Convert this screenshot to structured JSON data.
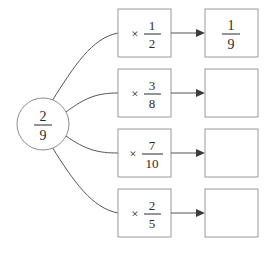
{
  "diagram": {
    "type": "fraction-multiplication-flow",
    "source": {
      "label": "2/9",
      "numerator": "2",
      "denominator": "9",
      "shape": "circle"
    },
    "operation_symbol": "×",
    "rows": [
      {
        "operation": {
          "symbol": "×",
          "numerator": "1",
          "denominator": "2",
          "label": "× 1/2"
        },
        "result": {
          "numerator": "1",
          "denominator": "9",
          "label": "1/9",
          "filled": true
        }
      },
      {
        "operation": {
          "symbol": "×",
          "numerator": "3",
          "denominator": "8",
          "label": "× 3/8"
        },
        "result": {
          "numerator": "",
          "denominator": "",
          "label": "",
          "filled": false
        }
      },
      {
        "operation": {
          "symbol": "×",
          "numerator": "7",
          "denominator": "10",
          "label": "× 7/10"
        },
        "result": {
          "numerator": "",
          "denominator": "",
          "label": "",
          "filled": false
        }
      },
      {
        "operation": {
          "symbol": "×",
          "numerator": "2",
          "denominator": "5",
          "label": "× 2/5"
        },
        "result": {
          "numerator": "",
          "denominator": "",
          "label": "",
          "filled": false
        }
      }
    ],
    "colors": {
      "background": "#ffffff",
      "box_stroke": "#9a9a9a",
      "circle_stroke": "#8c8c8c",
      "edge_stroke": "#555555",
      "arrow_fill": "#3d3d3d",
      "text": "#2b2b2b"
    }
  }
}
